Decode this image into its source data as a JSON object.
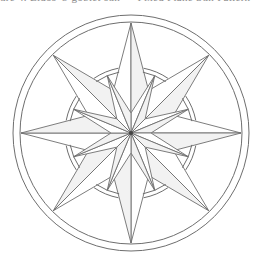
{
  "caption": "ure 4. Eidos' 8-goblet sun — Fixed Plane Sun Pattern",
  "diagram": {
    "type": "compass-rose",
    "center": [
      131,
      133
    ],
    "stroke_color": "#6e6e6e",
    "fill_color": "#ffffff",
    "shade_color": "#f2f2f2",
    "center_dot_color": "#444444",
    "outer_rings": [
      118,
      111
    ],
    "middle_rings": [
      66,
      62
    ],
    "long_points": {
      "count": 8,
      "start_angle_deg": 0,
      "tip_radius": 110,
      "base_radius": 46
    },
    "short_points": {
      "count": 8,
      "start_angle_deg": 22.5,
      "tip_radius": 62,
      "base_radius": 20
    },
    "center_dot_radius": 2
  }
}
